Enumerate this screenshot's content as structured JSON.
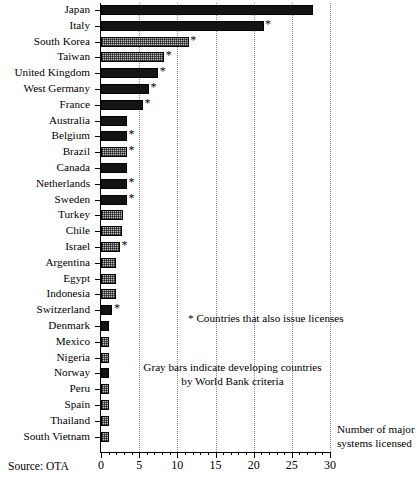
{
  "source_note": "Source: OTA",
  "axis_title": "Number of major systems licensed",
  "legend_note": "* Countries that also issue licenses",
  "gray_note": "Gray bars indicate developing countries by World Bank criteria",
  "star_symbol": "*",
  "colors": {
    "black_bar": "#141414",
    "gray_bar": "#bdbdbd",
    "gridline": "#8a8a8a",
    "axis": "#000000",
    "background": "#ffffff"
  },
  "chart_data": {
    "type": "bar",
    "orientation": "horizontal",
    "title": "",
    "subtitle": "",
    "xlabel": "Number of major systems licensed",
    "ylabel": "",
    "xlim": [
      0,
      30
    ],
    "grid": "vertical dotted gridlines at every 5 units",
    "legend_position": "inline annotations inside plot area",
    "xticks": [
      0,
      5,
      10,
      15,
      20,
      25,
      30
    ],
    "xtick_labels": [
      "0",
      "5",
      "10",
      "15",
      "20",
      "25",
      "30"
    ],
    "minor_tick_interval": 1,
    "categories": [
      "Japan",
      "Italy",
      "South Korea",
      "Taiwan",
      "United Kingdom",
      "West Germany",
      "France",
      "Australia",
      "Belgium",
      "Brazil",
      "Canada",
      "Netherlands",
      "Sweden",
      "Turkey",
      "Chile",
      "Israel",
      "Argentina",
      "Egypt",
      "Indonesia",
      "Switzerland",
      "Denmark",
      "Mexico",
      "Nigeria",
      "Norway",
      "Peru",
      "Spain",
      "Thailand",
      "South Vietnam"
    ],
    "values": [
      27.8,
      21.3,
      11.5,
      8.3,
      7.5,
      6.3,
      5.5,
      3.4,
      3.4,
      3.4,
      3.4,
      3.4,
      3.4,
      2.9,
      2.7,
      2.5,
      2.0,
      2.0,
      2.0,
      1.5,
      1.0,
      1.0,
      1.0,
      1.0,
      1.0,
      1.0,
      1.0,
      1.0
    ],
    "fills": [
      "black",
      "black",
      "gray",
      "gray",
      "black",
      "black",
      "black",
      "black",
      "black",
      "gray",
      "black",
      "black",
      "black",
      "gray",
      "gray",
      "gray",
      "gray",
      "gray",
      "gray",
      "black",
      "black",
      "gray",
      "gray",
      "black",
      "gray",
      "gray",
      "gray",
      "gray"
    ],
    "licenses_issued": [
      false,
      true,
      true,
      true,
      true,
      true,
      true,
      false,
      true,
      true,
      false,
      true,
      true,
      false,
      false,
      true,
      false,
      false,
      false,
      true,
      false,
      false,
      false,
      false,
      false,
      false,
      false,
      false
    ],
    "series": [
      {
        "name": "Number of major systems licensed",
        "values": [
          27.8,
          21.3,
          11.5,
          8.3,
          7.5,
          6.3,
          5.5,
          3.4,
          3.4,
          3.4,
          3.4,
          3.4,
          3.4,
          2.9,
          2.7,
          2.5,
          2.0,
          2.0,
          2.0,
          1.5,
          1.0,
          1.0,
          1.0,
          1.0,
          1.0,
          1.0,
          1.0,
          1.0
        ]
      }
    ],
    "annotations": [
      "* Countries that also issue licenses",
      "Gray bars indicate developing countries by World Bank criteria",
      "Source: OTA"
    ]
  }
}
